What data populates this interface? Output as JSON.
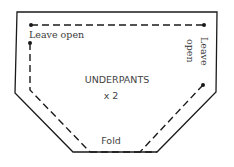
{
  "diagram": {
    "title": "UNDERPANTS",
    "quantity": "x 2",
    "labels": {
      "top_left": "Leave open",
      "right_line1": "Leave",
      "right_line2": "open",
      "bottom": "Fold"
    },
    "colors": {
      "line": "#1a1a1a",
      "text": "#3a3a3a",
      "background": "#ffffff"
    }
  }
}
